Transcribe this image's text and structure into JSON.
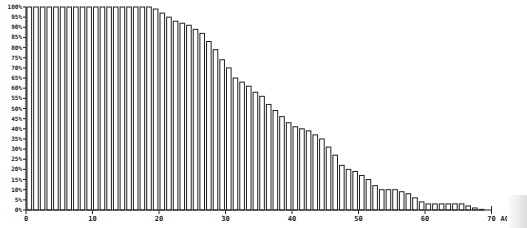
{
  "chart_data": {
    "type": "bar",
    "title": "",
    "xlabel": "AGE",
    "ylabel": "",
    "ylim": [
      0,
      100
    ],
    "xlim": [
      0,
      70
    ],
    "grid": false,
    "legend": null,
    "y_ticks": [
      "0%",
      "5%",
      "10%",
      "15%",
      "20%",
      "25%",
      "30%",
      "35%",
      "40%",
      "45%",
      "50%",
      "55%",
      "60%",
      "65%",
      "70%",
      "75%",
      "80%",
      "85%",
      "90%",
      "95%",
      "100%"
    ],
    "x_ticks": [
      "0",
      "10",
      "20",
      "30",
      "40",
      "50",
      "60",
      "70"
    ],
    "categories": [
      0,
      1,
      2,
      3,
      4,
      5,
      6,
      7,
      8,
      9,
      10,
      11,
      12,
      13,
      14,
      15,
      16,
      17,
      18,
      19,
      20,
      21,
      22,
      23,
      24,
      25,
      26,
      27,
      28,
      29,
      30,
      31,
      32,
      33,
      34,
      35,
      36,
      37,
      38,
      39,
      40,
      41,
      42,
      43,
      44,
      45,
      46,
      47,
      48,
      49,
      50,
      51,
      52,
      53,
      54,
      55,
      56,
      57,
      58,
      59,
      60,
      61,
      62,
      63,
      64,
      65,
      66,
      67,
      68
    ],
    "values": [
      100,
      100,
      100,
      100,
      100,
      100,
      100,
      100,
      100,
      100,
      100,
      100,
      100,
      100,
      100,
      100,
      100,
      100,
      100,
      99,
      97,
      95,
      93,
      92,
      91,
      89,
      87,
      83,
      79,
      74,
      70,
      65,
      63,
      61,
      58,
      56,
      52,
      49,
      46,
      43,
      41,
      40,
      39,
      37,
      35,
      31,
      27,
      22,
      20,
      19,
      17,
      15,
      12,
      10,
      10,
      10,
      9,
      8,
      6,
      4,
      3,
      3,
      3,
      3,
      3,
      3,
      2,
      1,
      0.3
    ]
  }
}
